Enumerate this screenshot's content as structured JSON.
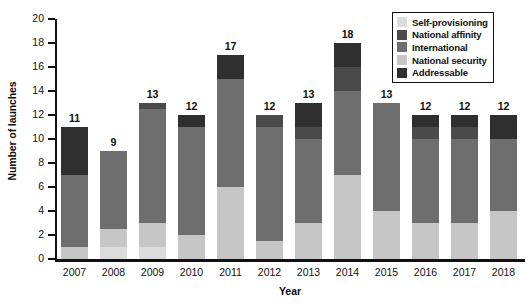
{
  "chart_data": {
    "type": "bar",
    "subtype": "stacked-bar",
    "title": "",
    "xlabel": "Year",
    "ylabel": "Number of launches",
    "ylim": [
      0,
      20
    ],
    "yticks": [
      0,
      2,
      4,
      6,
      8,
      10,
      12,
      14,
      16,
      18,
      20
    ],
    "grid": false,
    "legend_position": "top-right",
    "categories": [
      "2007",
      "2008",
      "2009",
      "2010",
      "2011",
      "2012",
      "2013",
      "2014",
      "2015",
      "2016",
      "2017",
      "2018"
    ],
    "stack_order_bottom_to_top": [
      "Self-provisioning",
      "National security",
      "International",
      "National affinity",
      "Addressable"
    ],
    "series": [
      {
        "name": "Addressable",
        "values": [
          4,
          0,
          0,
          1,
          2,
          0,
          2,
          2,
          0,
          1,
          1,
          2
        ]
      },
      {
        "name": "Self-provisioning",
        "values": [
          0,
          1,
          1,
          0,
          0,
          0,
          0,
          0,
          0,
          0,
          0,
          0
        ]
      },
      {
        "name": "National security",
        "values": [
          1,
          1.5,
          2,
          2,
          6,
          1.5,
          3,
          7,
          4,
          3,
          3,
          4
        ]
      },
      {
        "name": "International",
        "values": [
          6,
          6.5,
          9.5,
          9,
          9,
          9.5,
          7,
          7,
          9,
          7,
          7,
          6
        ]
      },
      {
        "name": "National affinity",
        "values": [
          0,
          0,
          0.5,
          0,
          0,
          1,
          1,
          2,
          0,
          1,
          1,
          0
        ]
      }
    ],
    "totals": [
      11,
      9,
      13,
      12,
      17,
      12,
      13,
      18,
      13,
      12,
      12,
      12
    ],
    "colors": {
      "Self-provisioning": "#dcdcdc",
      "National affinity": "#4a4a4a",
      "International": "#6e6e6e",
      "National security": "#c6c6c6",
      "Addressable": "#2f2f2f"
    }
  },
  "legend": {
    "items": [
      {
        "label": "Self-provisioning",
        "color": "#dcdcdc"
      },
      {
        "label": "National affinity",
        "color": "#4a4a4a"
      },
      {
        "label": "International",
        "color": "#6e6e6e"
      },
      {
        "label": "National security",
        "color": "#c6c6c6"
      },
      {
        "label": "Addressable",
        "color": "#2f2f2f"
      }
    ]
  }
}
